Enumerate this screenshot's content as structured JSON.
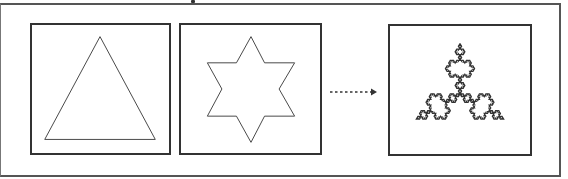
{
  "diagram": {
    "stages": [
      {
        "name": "triangle",
        "label": "Iteration 0: equilateral triangle"
      },
      {
        "name": "star",
        "label": "Iteration 1: six-pointed star"
      },
      {
        "name": "snowflake",
        "label": "Iteration n: Koch snowflake"
      }
    ],
    "arrow": {
      "style": "dotted",
      "meaning": "continue iterating"
    },
    "colors": {
      "line": "#333333",
      "frame": "#555555",
      "background": "#ffffff"
    }
  }
}
